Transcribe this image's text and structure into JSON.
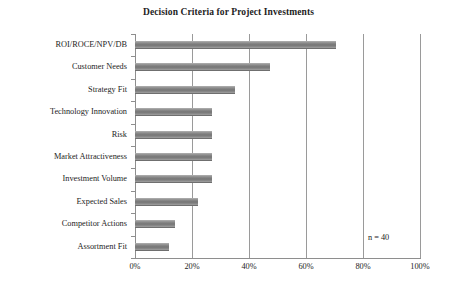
{
  "chart_data": {
    "type": "bar",
    "orientation": "horizontal",
    "title": "Decision Criteria for Project Investments",
    "xlabel": "",
    "ylabel": "",
    "xlim": [
      0,
      100
    ],
    "xticks": [
      0,
      20,
      40,
      60,
      80,
      100
    ],
    "xtick_labels": [
      "0%",
      "20%",
      "40%",
      "60%",
      "80%",
      "100%"
    ],
    "grid": "vertical",
    "legend": "none",
    "categories": [
      "ROI/ROCE/NPV/DB",
      "Customer Needs",
      "Strategy Fit",
      "Technology Innovation",
      "Risk",
      "Market Attractiveness",
      "Investment Volume",
      "Expected Sales",
      "Competitor Actions",
      "Assortment Fit"
    ],
    "values": [
      70.5,
      47.5,
      35,
      27,
      27,
      27,
      27,
      22,
      14,
      12
    ],
    "annotations": [
      {
        "text": "n = 40",
        "x": 82,
        "y": 1
      }
    ],
    "colors": {
      "bar": "#808080",
      "bar_light": "#9d9d9d",
      "bar_dark": "#6f6f6f",
      "grid": "#9a9a9a",
      "axis": "#8e8e8e",
      "text": "#1d1d1d",
      "background": "#ffffff"
    }
  }
}
